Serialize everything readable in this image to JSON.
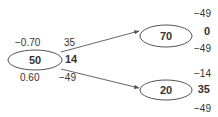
{
  "diagram": {
    "type": "tree",
    "nodes": {
      "root": {
        "value": "50",
        "top_left": "−0.70",
        "bottom_left": "0.60",
        "top_right": "35",
        "mid_right": "14",
        "bottom_right": "−49"
      },
      "upper_child": {
        "value": "70",
        "top": "−49",
        "mid": "0",
        "bottom": "−49"
      },
      "lower_child": {
        "value": "20",
        "top": "−14",
        "mid": "35",
        "bottom": "−49"
      }
    },
    "edges": [
      {
        "from": "root",
        "to": "upper_child"
      },
      {
        "from": "root",
        "to": "lower_child"
      }
    ],
    "colors": {
      "stroke": "#555555",
      "text": "#333333",
      "background": "#ffffff"
    }
  }
}
